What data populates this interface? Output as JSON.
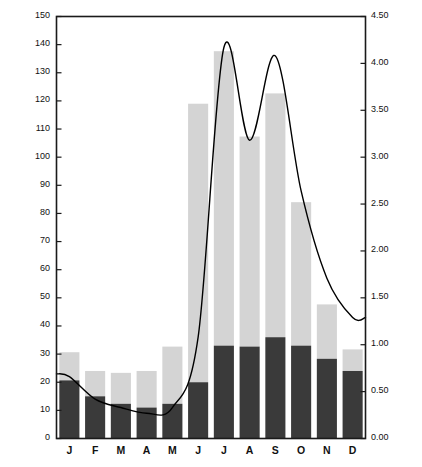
{
  "chart_data": {
    "type": "bar",
    "title": "",
    "subtitle": "",
    "categories": [
      "J",
      "F",
      "M",
      "A",
      "M",
      "J",
      "J",
      "A",
      "S",
      "O",
      "N",
      "D"
    ],
    "month_names": [
      "January",
      "February",
      "March",
      "April",
      "May",
      "June",
      "July",
      "August",
      "September",
      "October",
      "November",
      "December"
    ],
    "ylabel": "MEAN MONTHLY DISCHARGE (m³ / SEC. x 1000), 1951-1969",
    "ylabel_right": "MEAN MONTHLY MINIMUM AND MAXIMUM LEVELS",
    "xlabel": "",
    "ylim": [
      0,
      150
    ],
    "ylim_right": [
      0.0,
      4.5
    ],
    "yticks": [
      0,
      10,
      20,
      30,
      40,
      50,
      60,
      70,
      80,
      90,
      100,
      110,
      120,
      130,
      140,
      150
    ],
    "ytick_labels": [
      "0",
      "10",
      "20",
      "30",
      "40",
      "50",
      "60",
      "70",
      "80",
      "90",
      "100",
      "110",
      "120",
      "130",
      "140",
      "150"
    ],
    "yticks_right": [
      0.0,
      0.5,
      1.0,
      1.5,
      2.0,
      2.5,
      3.0,
      3.5,
      4.0,
      4.5
    ],
    "ytick_labels_right": [
      "0.00",
      "0.50",
      "1.00",
      "1.50",
      "2.00",
      "2.50",
      "3.00",
      "3.50",
      "4.00",
      "4.50"
    ],
    "grid": false,
    "legend_position": "none",
    "series": [
      {
        "name": "Mean monthly minimum level",
        "axis": "right",
        "type": "bar",
        "color": "#3a3a3a",
        "values": [
          0.62,
          0.45,
          0.37,
          0.33,
          0.37,
          0.6,
          0.99,
          0.98,
          1.08,
          0.99,
          0.85,
          0.72
        ]
      },
      {
        "name": "Mean monthly maximum level",
        "axis": "right",
        "type": "bar",
        "color": "#d4d4d4",
        "values": [
          0.92,
          0.72,
          0.7,
          0.72,
          0.98,
          3.57,
          4.13,
          3.22,
          3.68,
          2.52,
          1.43,
          0.95
        ]
      },
      {
        "name": "Mean monthly discharge",
        "axis": "left",
        "type": "line",
        "color": "#000000",
        "values": [
          22,
          14,
          11,
          9,
          11,
          36,
          139,
          106,
          136,
          88,
          57,
          43
        ]
      }
    ],
    "bar_segments": {
      "dark_label": "minimum level",
      "light_label": "maximum level"
    }
  },
  "axes": {
    "left_title": "MEAN MONTHLY DISCHARGE (m³ / SEC. x 1000), 1951-1969",
    "right_title": "MEAN MONTHLY MINIMUM AND MAXIMUM LEVELS"
  },
  "colors": {
    "bar_dark": "#3a3a3a",
    "bar_light": "#d4d4d4",
    "line": "#000000",
    "frame": "#1a1a1a",
    "background": "#ffffff"
  }
}
